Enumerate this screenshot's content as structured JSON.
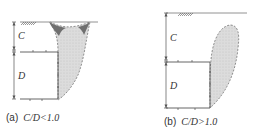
{
  "panels": [
    {
      "id": "a",
      "caption_label": "(a)",
      "caption_math": "C/D<1.0",
      "dim_upper": "C",
      "dim_lower": "D"
    },
    {
      "id": "b",
      "caption_label": "(b)",
      "caption_math": "C/D>1.0",
      "dim_upper": "C",
      "dim_lower": "D"
    }
  ],
  "colors": {
    "line": "#555555",
    "zone_fill": "#d9d9d9",
    "surface_zone_fill": "#6f6f6f",
    "ground_hatch": "#555555"
  }
}
